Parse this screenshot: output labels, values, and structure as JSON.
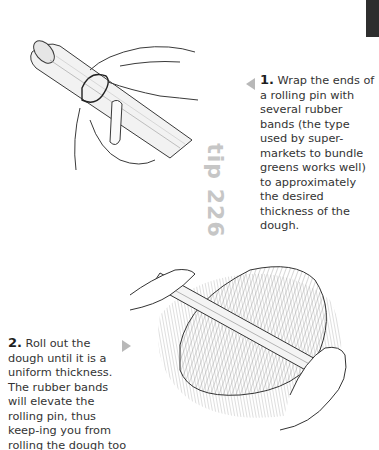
{
  "page": {
    "tip_label": "tip 226",
    "accent_color": "#c6c6c6",
    "tab_color": "#2e2e2e"
  },
  "steps": [
    {
      "number": "1.",
      "text": "Wrap the ends of a rolling pin with several rubber bands (the type used by super-markets to bundle greens works well) to approximately the desired thickness of the dough.",
      "arrow": "left-arrow-icon"
    },
    {
      "number": "2.",
      "text": "Roll out the dough until it is a uniform thickness. The rubber bands will elevate the rolling pin, thus keep-ing you from rolling the dough too thin.",
      "arrow": "right-arrow-icon"
    }
  ],
  "illustrations": [
    {
      "name": "hands-wrapping-rubber-band-on-rolling-pin"
    },
    {
      "name": "hands-rolling-dough-with-rolling-pin"
    }
  ]
}
